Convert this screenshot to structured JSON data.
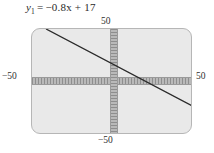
{
  "figure": {
    "name": "graphing-calculator-viewing-window"
  },
  "equation": {
    "variable": "y",
    "subscript": "1",
    "relation": "=",
    "expression": "−0.8x + 17",
    "full_text": "y₁ = −0.8x + 17"
  },
  "window": {
    "xmin": -50,
    "xmax": 50,
    "ymin": -50,
    "ymax": 50,
    "labels": {
      "top": "50",
      "bottom": "−50",
      "left": "−50",
      "right": "50"
    }
  },
  "colors": {
    "panel_background": "#e9e9e9",
    "panel_border": "#b6b6b6",
    "axis": "#8e8e8e",
    "line": "#2b2b2b",
    "text": "#2f2f2f",
    "page_background": "#ffffff"
  },
  "chart_data": {
    "type": "line",
    "xlabel": "",
    "ylabel": "",
    "xlim": [
      -50,
      50
    ],
    "ylim": [
      -50,
      50
    ],
    "grid": false,
    "legend": "none",
    "axis_ticks": true,
    "series": [
      {
        "name": "y₁ = −0.8x + 17",
        "equation": "y = -0.8x + 17",
        "slope": -0.8,
        "intercept": 17,
        "x": [
          -40,
          -20,
          0,
          20,
          40,
          50
        ],
        "y": [
          49,
          33,
          17,
          1,
          -15,
          -23
        ],
        "x_intercept": 21.25,
        "y_intercept": 17,
        "color": "#2b2b2b"
      }
    ],
    "annotations": [
      {
        "text": "50",
        "position": "top-axis-end"
      },
      {
        "text": "−50",
        "position": "bottom-axis-end"
      },
      {
        "text": "−50",
        "position": "left-axis-end"
      },
      {
        "text": "50",
        "position": "right-axis-end"
      }
    ]
  }
}
